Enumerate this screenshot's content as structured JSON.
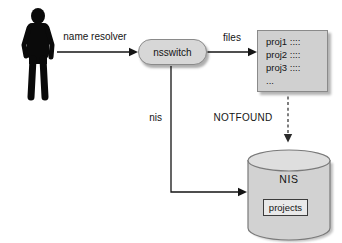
{
  "actor": {
    "icon": "person-silhouette"
  },
  "edges": {
    "name_resolver_label": "name resolver",
    "files_label": "files",
    "nis_label": "nis",
    "notfound_label": "NOTFOUND"
  },
  "nsswitch": {
    "label": "nsswitch"
  },
  "files_store": {
    "rows": [
      "proj1 ::::",
      "proj2 ::::",
      "proj3 ::::",
      "..."
    ]
  },
  "nis_store": {
    "label": "NIS",
    "table": "projects"
  },
  "colors": {
    "background": "#ffffff",
    "node_fill": "#d7d7d7",
    "node_border": "#8a8a8a",
    "cylinder_fill": "#d2d2d2",
    "cylinder_top_fill": "#dedede",
    "arrow": "#141414",
    "silhouette": "#0a0a0a"
  }
}
